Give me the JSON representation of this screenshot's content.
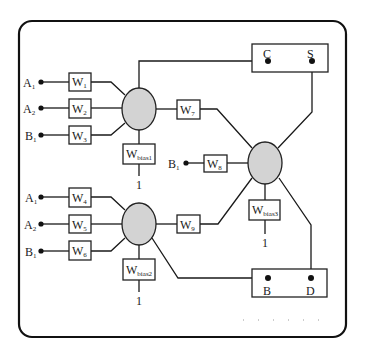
{
  "diagram": {
    "type": "neural-network-schematic",
    "colors": {
      "neuron_fill": "#d3d3d3",
      "stroke": "#222222",
      "background": "#ffffff"
    },
    "inputs_group1": [
      {
        "label": "A",
        "sub": "1"
      },
      {
        "label": "A",
        "sub": "2"
      },
      {
        "label": "B",
        "sub": "1"
      }
    ],
    "inputs_group2": [
      {
        "label": "A",
        "sub": "1"
      },
      {
        "label": "A",
        "sub": "2"
      },
      {
        "label": "B",
        "sub": "1"
      }
    ],
    "input_neuron3": {
      "label": "B",
      "sub": "1"
    },
    "weights": [
      {
        "label": "W",
        "sub": "1"
      },
      {
        "label": "W",
        "sub": "2"
      },
      {
        "label": "W",
        "sub": "3"
      },
      {
        "label": "W",
        "sub": "4"
      },
      {
        "label": "W",
        "sub": "5"
      },
      {
        "label": "W",
        "sub": "6"
      },
      {
        "label": "W",
        "sub": "7"
      },
      {
        "label": "W",
        "sub": "8"
      },
      {
        "label": "W",
        "sub": "9"
      }
    ],
    "biases": [
      {
        "label": "W",
        "sub": "bias1",
        "input": "1"
      },
      {
        "label": "W",
        "sub": "bias2",
        "input": "1"
      },
      {
        "label": "W",
        "sub": "bias3",
        "input": "1"
      }
    ],
    "outputs_top": {
      "left": "C",
      "right": "S"
    },
    "outputs_bottom": {
      "left": "B",
      "right": "D"
    }
  }
}
